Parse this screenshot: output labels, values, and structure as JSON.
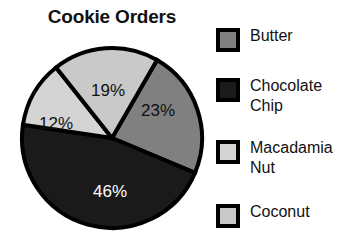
{
  "chart_data": {
    "type": "pie",
    "title": "Cookie Orders",
    "categories": [
      "Butter",
      "Chocolate Chip",
      "Macadamia Nut",
      "Coconut"
    ],
    "values": [
      23,
      46,
      12,
      19
    ],
    "value_labels": [
      "23%",
      "46%",
      "12%",
      "19%"
    ],
    "units": "percent",
    "legend_position": "right",
    "grid": false,
    "xlabel": "",
    "ylabel": "",
    "slice_colors": [
      "#808080",
      "#1a1a1a",
      "#d4d4d4",
      "#c9c9c9"
    ],
    "slice_label_colors": [
      "#111111",
      "#ffffff",
      "#111111",
      "#111111"
    ],
    "outline_color": "#000000",
    "background": "#ffffff",
    "slices": [
      {
        "name": "Butter",
        "value": 23,
        "label": "23%",
        "color": "#808080",
        "label_color": "#111111",
        "start_angle_deg": 30.0,
        "sweep_deg": 82.8,
        "label_x": 140,
        "label_y": 70
      },
      {
        "name": "Chocolate Chip",
        "value": 46,
        "label": "46%",
        "color": "#1a1a1a",
        "label_color": "#ffffff",
        "start_angle_deg": 112.8,
        "sweep_deg": 165.6,
        "label_x": 92,
        "label_y": 151
      },
      {
        "name": "Macadamia Nut",
        "value": 12,
        "label": "12%",
        "color": "#d4d4d4",
        "label_color": "#111111",
        "start_angle_deg": 278.4,
        "sweep_deg": 43.2,
        "label_x": 38,
        "label_y": 83
      },
      {
        "name": "Coconut",
        "value": 19,
        "label": "19%",
        "color": "#c9c9c9",
        "label_color": "#111111",
        "start_angle_deg": 321.6,
        "sweep_deg": 68.4,
        "label_x": 90,
        "label_y": 50
      }
    ],
    "geometry": {
      "center_x": 94,
      "center_y": 96,
      "radius": 90
    }
  },
  "legend": {
    "items": [
      {
        "label": "Butter",
        "color": "#808080",
        "top": 12
      },
      {
        "label": "Chocolate Chip",
        "color": "#1a1a1a",
        "top": 62
      },
      {
        "label": "Macadamia Nut",
        "color": "#d4d4d4",
        "top": 124
      },
      {
        "label": "Coconut",
        "color": "#c9c9c9",
        "top": 188
      }
    ]
  }
}
